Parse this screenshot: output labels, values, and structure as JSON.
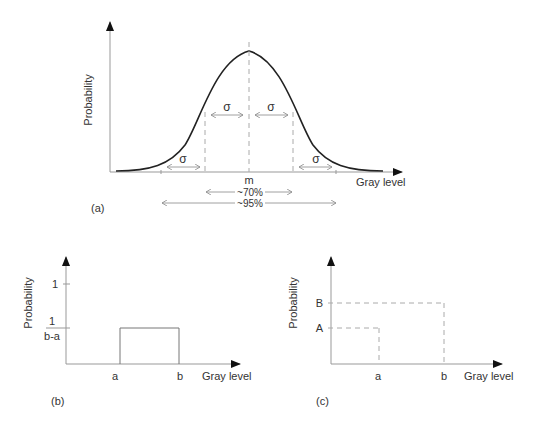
{
  "panel_a": {
    "tag": "(a)",
    "ylabel": "Probability",
    "xlabel": "Gray level",
    "mean_label": "m",
    "sigma_label": "σ",
    "range_70": "~70%",
    "range_95": "~95%",
    "curve": "Gaussian"
  },
  "panel_b": {
    "tag": "(b)",
    "ylabel": "Probability",
    "xlabel": "Gray level",
    "ytick_1": "1",
    "ytick_frac_num": "1",
    "ytick_frac_den": "b-a",
    "xtick_a": "a",
    "xtick_b": "b",
    "curve": "Uniform"
  },
  "panel_c": {
    "tag": "(c)",
    "ylabel": "Probability",
    "xlabel": "Gray level",
    "ytick_A": "A",
    "ytick_B": "B",
    "xtick_a": "a",
    "xtick_b": "b"
  },
  "colors": {
    "axis": "#999999",
    "curve": "#222222",
    "dash": "#aaaaaa",
    "text": "#333333"
  }
}
